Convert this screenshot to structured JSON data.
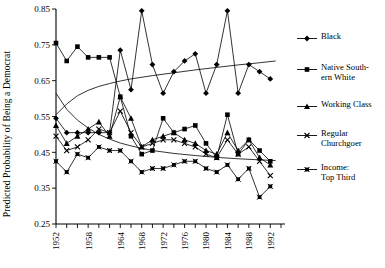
{
  "chart_data": {
    "type": "line",
    "title": "",
    "xlabel": "",
    "ylabel": "Predicted Probability of Being a Democrat",
    "xlim": [
      1952,
      1994
    ],
    "ylim": [
      0.25,
      0.85
    ],
    "yticks": [
      "0.25",
      "0.35",
      "0.45",
      "0.55",
      "0.65",
      "0.75",
      "0.85"
    ],
    "ytick_values": [
      0.25,
      0.35,
      0.45,
      0.55,
      0.65,
      0.75,
      0.85
    ],
    "xticks": [
      "1952",
      "1958",
      "1964",
      "1968",
      "1972",
      "1976",
      "1980",
      "1984",
      "1988",
      "1992"
    ],
    "xtick_values": [
      1952,
      1958,
      1964,
      1968,
      1972,
      1976,
      1980,
      1984,
      1988,
      1992
    ],
    "x": [
      1952,
      1954,
      1956,
      1958,
      1960,
      1962,
      1964,
      1966,
      1968,
      1970,
      1972,
      1974,
      1976,
      1978,
      1980,
      1982,
      1984,
      1986,
      1988,
      1990,
      1992
    ],
    "grid": false,
    "legend_position": "right",
    "series": [
      {
        "name": "Black",
        "marker": "diamond",
        "values": [
          0.545,
          0.505,
          0.505,
          0.505,
          0.505,
          0.505,
          0.735,
          0.625,
          0.845,
          0.695,
          0.615,
          0.675,
          0.705,
          0.725,
          0.615,
          0.695,
          0.845,
          0.615,
          0.695,
          0.675,
          0.655
        ]
      },
      {
        "name": "Native South-\nern White",
        "marker": "square",
        "values": [
          0.755,
          0.705,
          0.745,
          0.715,
          0.715,
          0.715,
          0.605,
          0.495,
          0.445,
          0.455,
          0.545,
          0.505,
          0.515,
          0.525,
          0.475,
          0.435,
          0.555,
          0.445,
          0.485,
          0.455,
          0.425
        ]
      },
      {
        "name": "Working Class",
        "marker": "triangle",
        "values": [
          0.525,
          0.475,
          0.495,
          0.515,
          0.535,
          0.495,
          0.605,
          0.545,
          0.465,
          0.485,
          0.495,
          0.505,
          0.485,
          0.475,
          0.455,
          0.445,
          0.505,
          0.455,
          0.485,
          0.435,
          0.415
        ]
      },
      {
        "name": "Regular\nChurchgoer",
        "marker": "x",
        "values": [
          0.495,
          0.455,
          0.465,
          0.485,
          0.515,
          0.505,
          0.565,
          0.505,
          0.465,
          0.475,
          0.485,
          0.485,
          0.475,
          0.465,
          0.445,
          0.435,
          0.485,
          0.445,
          0.465,
          0.425,
          0.385
        ]
      },
      {
        "name": "Income:\nTop Third",
        "marker": "x-square",
        "values": [
          0.425,
          0.395,
          0.445,
          0.435,
          0.465,
          0.455,
          0.455,
          0.425,
          0.395,
          0.405,
          0.405,
          0.415,
          0.425,
          0.425,
          0.405,
          0.395,
          0.415,
          0.375,
          0.405,
          0.325,
          0.355
        ]
      }
    ],
    "trend_curves": [
      {
        "name": "rising-trend",
        "points": [
          [
            1952,
            0.555
          ],
          [
            1954,
            0.585
          ],
          [
            1956,
            0.608
          ],
          [
            1958,
            0.623
          ],
          [
            1960,
            0.634
          ],
          [
            1962,
            0.642
          ],
          [
            1964,
            0.649
          ],
          [
            1966,
            0.655
          ],
          [
            1970,
            0.664
          ],
          [
            1974,
            0.672
          ],
          [
            1978,
            0.68
          ],
          [
            1982,
            0.687
          ],
          [
            1986,
            0.694
          ],
          [
            1990,
            0.7
          ],
          [
            1993,
            0.705
          ]
        ]
      },
      {
        "name": "falling-trend",
        "points": [
          [
            1952,
            0.615
          ],
          [
            1954,
            0.57
          ],
          [
            1956,
            0.54
          ],
          [
            1958,
            0.518
          ],
          [
            1960,
            0.5
          ],
          [
            1962,
            0.487
          ],
          [
            1964,
            0.476
          ],
          [
            1966,
            0.468
          ],
          [
            1970,
            0.455
          ],
          [
            1974,
            0.447
          ],
          [
            1978,
            0.441
          ],
          [
            1982,
            0.436
          ],
          [
            1986,
            0.432
          ],
          [
            1990,
            0.429
          ],
          [
            1993,
            0.427
          ]
        ]
      }
    ]
  },
  "legend": {
    "items": [
      {
        "label": "Black",
        "marker": "diamond-marker"
      },
      {
        "label": "Native South-\nern White",
        "marker": "square-marker"
      },
      {
        "label": "Working Class",
        "marker": "triangle-marker"
      },
      {
        "label": "Regular\nChurchgoer",
        "marker": "x-marker"
      },
      {
        "label": "Income:\nTop Third",
        "marker": "x-square-marker"
      }
    ]
  },
  "axis": {
    "y_title": "Predicted Probability of Being a Democrat"
  }
}
